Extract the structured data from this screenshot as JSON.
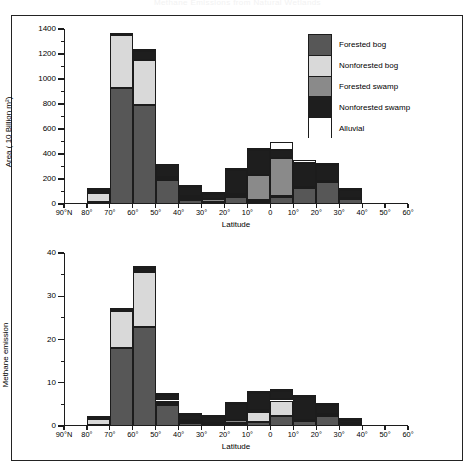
{
  "figure": {
    "title": "Methane Emissions from Natural Wetlands",
    "legend": {
      "title": "",
      "entries": [
        {
          "label": "Forested bog",
          "color": "#575757"
        },
        {
          "label": "Nonforested bog",
          "color": "#d9d9d9"
        },
        {
          "label": "Forested swamp",
          "color": "#8a8a8a"
        },
        {
          "label": "Nonforested swamp",
          "color": "#1e1e1e"
        },
        {
          "label": "Alluvial",
          "color": "#ffffff"
        }
      ]
    }
  },
  "chart_data": [
    {
      "type": "bar",
      "stacked": true,
      "panel": "top",
      "title": "",
      "xlabel": "Latitude",
      "ylabel": "Area ( 10 Billion m²)",
      "ylim": [
        0,
        1400
      ],
      "yticks": [
        0,
        200,
        400,
        600,
        800,
        1000,
        1200,
        1400
      ],
      "ytick_labels": [
        "0",
        "200",
        "400",
        "600",
        "800",
        "1000",
        "1200",
        "1400"
      ],
      "grid": false,
      "legend_position": "top-right",
      "categories": [
        "90°N",
        "80°",
        "70°",
        "60°",
        "50°",
        "40°",
        "30°",
        "20°",
        "10°",
        "0",
        "10°",
        "20°",
        "30°",
        "40°",
        "50°",
        "60°"
      ],
      "bin_count": 15,
      "series": [
        {
          "name": "Forested bog",
          "color": "#575757",
          "values": [
            0,
            15,
            930,
            790,
            195,
            35,
            10,
            55,
            20,
            60,
            125,
            180,
            40,
            0,
            0
          ]
        },
        {
          "name": "Nonforested bog",
          "color": "#d9d9d9",
          "values": [
            0,
            75,
            420,
            360,
            10,
            10,
            10,
            10,
            10,
            5,
            0,
            0,
            0,
            0,
            0
          ]
        },
        {
          "name": "Forested swamp",
          "color": "#8a8a8a",
          "values": [
            0,
            15,
            0,
            5,
            10,
            20,
            20,
            15,
            205,
            305,
            10,
            5,
            10,
            0,
            0
          ]
        },
        {
          "name": "Nonforested swamp",
          "color": "#1e1e1e",
          "values": [
            0,
            10,
            10,
            70,
            105,
            70,
            40,
            195,
            195,
            65,
            190,
            125,
            65,
            0,
            0
          ]
        },
        {
          "name": "Alluvial",
          "color": "#ffffff",
          "values": [
            0,
            10,
            0,
            10,
            0,
            15,
            5,
            5,
            5,
            65,
            30,
            20,
            15,
            0,
            0
          ]
        }
      ],
      "totals": [
        0,
        125,
        1360,
        1235,
        320,
        150,
        85,
        280,
        435,
        500,
        355,
        330,
        130,
        0,
        0
      ]
    },
    {
      "type": "bar",
      "stacked": true,
      "panel": "bottom",
      "title": "",
      "xlabel": "Latitude",
      "ylabel": "Methane emission",
      "ylim": [
        0,
        40
      ],
      "yticks": [
        0,
        10,
        20,
        30,
        40
      ],
      "ytick_labels": [
        "0",
        "10",
        "20",
        "30",
        "40"
      ],
      "grid": false,
      "legend_position": "none",
      "categories": [
        "90°N",
        "80°",
        "70°",
        "60°",
        "50°",
        "40°",
        "30°",
        "20°",
        "10°",
        "0",
        "10°",
        "20°",
        "30°",
        "40°",
        "50°",
        "60°"
      ],
      "bin_count": 15,
      "series": [
        {
          "name": "Forested bog",
          "color": "#575757",
          "values": [
            0,
            0.2,
            18.0,
            23.0,
            4.8,
            0.8,
            0.2,
            0.5,
            1.0,
            2.3,
            1.1,
            2.4,
            0.5,
            0,
            0
          ]
        },
        {
          "name": "Nonforested bog",
          "color": "#d9d9d9",
          "values": [
            0,
            1.5,
            8.5,
            12.5,
            0.6,
            0.3,
            0.2,
            0.3,
            2.2,
            3.6,
            0.1,
            0.1,
            0.1,
            0,
            0
          ]
        },
        {
          "name": "Forested swamp",
          "color": "#8a8a8a",
          "values": [
            0,
            0.2,
            0.1,
            0.4,
            0.5,
            0.4,
            0.4,
            0.5,
            0.4,
            0.4,
            0.2,
            0.2,
            0.2,
            0,
            0
          ]
        },
        {
          "name": "Nonforested swamp",
          "color": "#1e1e1e",
          "values": [
            0,
            0.2,
            0.6,
            0.7,
            1.2,
            1.0,
            1.2,
            3.7,
            4.0,
            1.9,
            5.4,
            2.1,
            0.5,
            0,
            0
          ]
        },
        {
          "name": "Alluvial",
          "color": "#ffffff",
          "values": [
            0,
            0.0,
            0.0,
            0.1,
            0.1,
            0.1,
            0.1,
            0.1,
            0.3,
            0.4,
            0.3,
            0.3,
            0.1,
            0,
            0
          ]
        }
      ],
      "totals": [
        0,
        2.1,
        27.2,
        36.7,
        7.2,
        2.6,
        2.1,
        5.1,
        7.9,
        8.6,
        7.1,
        5.1,
        1.4,
        0,
        0
      ]
    }
  ]
}
